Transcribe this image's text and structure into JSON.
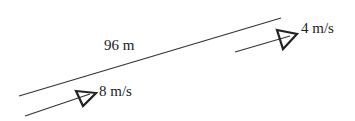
{
  "diagram": {
    "track_label": "96 m",
    "objects": [
      {
        "name": "object-a",
        "speed_label": "8 m/s"
      },
      {
        "name": "object-b",
        "speed_label": "4 m/s"
      }
    ]
  }
}
